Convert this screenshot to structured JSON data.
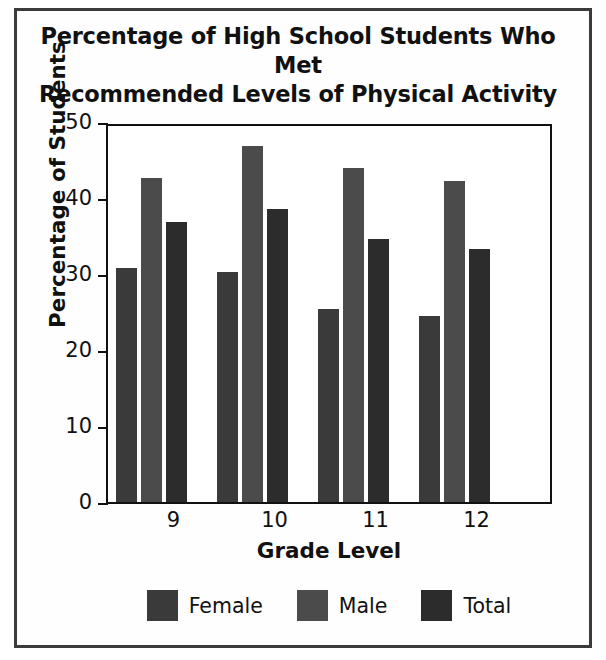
{
  "figure": {
    "title_line1": "Percentage of High School Students Who Met",
    "title_line2": "Recommended Levels of Physical Activity"
  },
  "chart_data": {
    "type": "bar",
    "title": "Percentage of High School Students Who Met Recommended Levels of Physical Activity",
    "xlabel": "Grade Level",
    "ylabel": "Percentage of Students",
    "categories": [
      "9",
      "10",
      "11",
      "12"
    ],
    "series": [
      {
        "name": "Female",
        "color": "#3a3a3a",
        "values": [
          30.8,
          30.2,
          25.4,
          24.5
        ]
      },
      {
        "name": "Male",
        "color": "#4b4b4b",
        "values": [
          42.6,
          46.9,
          44.0,
          42.2
        ]
      },
      {
        "name": "Total",
        "color": "#2c2c2c",
        "values": [
          36.8,
          38.5,
          34.6,
          33.3
        ]
      }
    ],
    "ylim": [
      0,
      50
    ],
    "yticks": [
      0,
      10,
      20,
      30,
      40,
      50
    ],
    "ytick_labels": [
      "0",
      "10",
      "20",
      "30",
      "40",
      "50"
    ],
    "grid": false,
    "legend_position": "bottom"
  },
  "legend": {
    "items": [
      {
        "label": "Female",
        "color": "#3a3a3a"
      },
      {
        "label": "Male",
        "color": "#4b4b4b"
      },
      {
        "label": "Total",
        "color": "#2c2c2c"
      }
    ]
  }
}
